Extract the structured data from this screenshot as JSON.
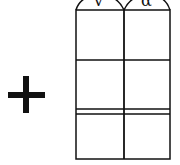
{
  "diagram": {
    "operator": "+",
    "column_labels": [
      "v",
      "α"
    ],
    "grid": {
      "columns": 2,
      "rows": 3,
      "double_line_between_rows": [
        2,
        3
      ],
      "stroke_color": "#111111"
    }
  }
}
